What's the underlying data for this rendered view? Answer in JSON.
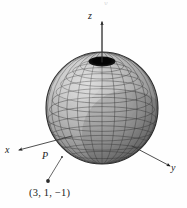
{
  "figure": {
    "background_color": "#fefefe",
    "ink_color": "#1a1a1a",
    "mesh_color": "#3a3a3a",
    "sphere_fill_light": "#cfcfcf",
    "sphere_fill_dark": "#6e6e6e",
    "polar_hole_color": "#141414"
  },
  "axes": {
    "x_label": "x",
    "y_label": "y",
    "z_label": "z",
    "origin_px": {
      "x": 102,
      "y": 138
    }
  },
  "sphere": {
    "center_px": {
      "x": 102,
      "y": 108
    },
    "radius_px": 56,
    "meridian_count": 24,
    "parallel_count": 16
  },
  "annotations": {
    "point_label": "P",
    "coordinate_label": "(3, 1, −1)",
    "coordinates": [
      3,
      1,
      -1
    ],
    "leader_dot_px": {
      "x": 48,
      "y": 181
    },
    "point_on_sphere_px": {
      "x": 62,
      "y": 158
    }
  },
  "artifacts": {
    "top_cropped_text": "y"
  }
}
